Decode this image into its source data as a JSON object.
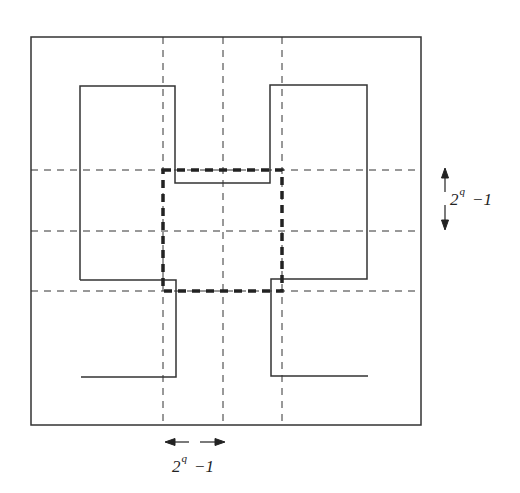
{
  "diagram": {
    "colors": {
      "line": "#333333",
      "background": "#ffffff"
    },
    "outer_box": {
      "x": 31,
      "y": 37,
      "w": 390,
      "h": 388
    },
    "grid": {
      "vertical_dashed_x": [
        163,
        223,
        282
      ],
      "horizontal_dashed_y": [
        170,
        231,
        291
      ]
    },
    "center_block": {
      "x": 163,
      "y": 170,
      "w": 119,
      "h": 121,
      "style": "thick-dashed"
    },
    "labels": {
      "vertical_span": {
        "base": "2",
        "exp": "q",
        "suffix": "−1"
      },
      "horizontal_span": {
        "base": "2",
        "exp": "q",
        "suffix": "−1"
      }
    }
  }
}
